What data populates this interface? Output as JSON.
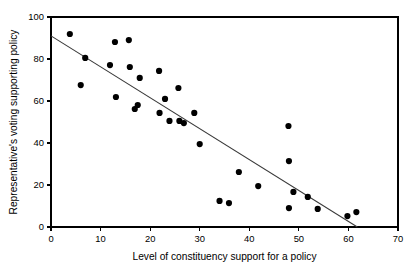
{
  "chart_data": {
    "type": "scatter",
    "title": "",
    "xlabel": "Level of constituency support for a policy",
    "ylabel": "Representative's voting supporting policy",
    "xlim": [
      0,
      70
    ],
    "ylim": [
      0,
      100
    ],
    "xticks": [
      0,
      10,
      20,
      30,
      40,
      50,
      60,
      70
    ],
    "yticks": [
      0,
      20,
      40,
      60,
      80,
      100
    ],
    "xtick_labels": [
      "0",
      "10",
      "20",
      "30",
      "40",
      "50",
      "60",
      "70"
    ],
    "ytick_labels": [
      "0",
      "20",
      "40",
      "60",
      "80",
      "100"
    ],
    "grid": false,
    "legend": false,
    "marker": {
      "shape": "circle",
      "color": "#000000",
      "size": 3.1
    },
    "points": [
      {
        "x": 3.8,
        "y": 91.9
      },
      {
        "x": 6.0,
        "y": 67.6
      },
      {
        "x": 6.9,
        "y": 80.5
      },
      {
        "x": 11.9,
        "y": 77.1
      },
      {
        "x": 12.9,
        "y": 88.1
      },
      {
        "x": 13.1,
        "y": 61.9
      },
      {
        "x": 15.7,
        "y": 89.0
      },
      {
        "x": 15.9,
        "y": 76.2
      },
      {
        "x": 16.9,
        "y": 56.2
      },
      {
        "x": 17.5,
        "y": 58.1
      },
      {
        "x": 17.9,
        "y": 71.0
      },
      {
        "x": 21.8,
        "y": 74.3
      },
      {
        "x": 21.9,
        "y": 54.3
      },
      {
        "x": 23.0,
        "y": 61.0
      },
      {
        "x": 23.9,
        "y": 50.5
      },
      {
        "x": 25.7,
        "y": 66.2
      },
      {
        "x": 25.9,
        "y": 50.5
      },
      {
        "x": 26.8,
        "y": 49.5
      },
      {
        "x": 28.9,
        "y": 54.3
      },
      {
        "x": 30.0,
        "y": 39.5
      },
      {
        "x": 34.0,
        "y": 12.4
      },
      {
        "x": 35.9,
        "y": 11.4
      },
      {
        "x": 37.9,
        "y": 26.2
      },
      {
        "x": 41.8,
        "y": 19.5
      },
      {
        "x": 47.9,
        "y": 48.1
      },
      {
        "x": 48.0,
        "y": 31.4
      },
      {
        "x": 48.0,
        "y": 9.0
      },
      {
        "x": 48.9,
        "y": 16.7
      },
      {
        "x": 51.8,
        "y": 14.3
      },
      {
        "x": 53.8,
        "y": 8.6
      },
      {
        "x": 59.8,
        "y": 5.2
      },
      {
        "x": 61.6,
        "y": 7.1
      }
    ],
    "fit_line": {
      "type": "linear",
      "x_start": 0,
      "y_start": 91.0,
      "x_end": 61.8,
      "y_end": 0.0
    }
  }
}
